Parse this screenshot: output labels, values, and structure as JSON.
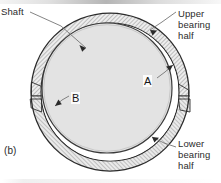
{
  "figure": {
    "caption": "(b)",
    "type": "engineering-cross-section",
    "labels": {
      "shaft": "Shaft",
      "upper_bearing_half": [
        "Upper",
        "bearing",
        "half"
      ],
      "lower_bearing_half": [
        "Lower",
        "bearing",
        "half"
      ],
      "callout_a": "A",
      "callout_b": "B"
    },
    "colors": {
      "outline": "#2b2b2b",
      "hatch_line": "#8a8a8a",
      "bearing_fill": "#e8e8e8",
      "shaft_fill": "#e2e2e2",
      "clearance_fill": "#ffffff",
      "leader_line": "#6e6e6e",
      "text": "#2b2b2b",
      "background": "#ffffff"
    },
    "geometry": {
      "bearing_center_x": 110,
      "bearing_center_y": 92,
      "bearing_outer_radius": 79,
      "bearing_inner_radius": 69,
      "shaft_center_x": 107,
      "shaft_center_y": 88,
      "shaft_radius": 65,
      "parting_line_y": 96,
      "eccentricity_direction": "up-left"
    }
  }
}
